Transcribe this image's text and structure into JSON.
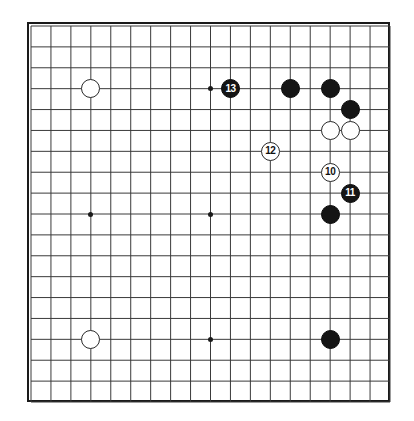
{
  "board": {
    "title": "Go board diagram",
    "size": 19,
    "line_color": "#3a3a3a",
    "border_color": "#1a1a1a",
    "background_color": "#ffffff",
    "black_stone_color": "#151515",
    "white_stone_color": "#ffffff",
    "star_points": [
      {
        "col": 3,
        "row": 3
      },
      {
        "col": 9,
        "row": 3
      },
      {
        "col": 15,
        "row": 3
      },
      {
        "col": 3,
        "row": 9
      },
      {
        "col": 9,
        "row": 9
      },
      {
        "col": 15,
        "row": 9
      },
      {
        "col": 3,
        "row": 15
      },
      {
        "col": 9,
        "row": 15
      },
      {
        "col": 15,
        "row": 15
      }
    ],
    "stones": [
      {
        "color": "white",
        "col": 3,
        "row": 3,
        "label": ""
      },
      {
        "color": "black",
        "col": 10,
        "row": 3,
        "label": "13"
      },
      {
        "color": "black",
        "col": 13,
        "row": 3,
        "label": ""
      },
      {
        "color": "black",
        "col": 15,
        "row": 3,
        "label": ""
      },
      {
        "color": "black",
        "col": 16,
        "row": 4,
        "label": ""
      },
      {
        "color": "white",
        "col": 15,
        "row": 5,
        "label": ""
      },
      {
        "color": "white",
        "col": 16,
        "row": 5,
        "label": ""
      },
      {
        "color": "white",
        "col": 12,
        "row": 6,
        "label": "12"
      },
      {
        "color": "white",
        "col": 15,
        "row": 7,
        "label": "10"
      },
      {
        "color": "black",
        "col": 16,
        "row": 8,
        "label": "11"
      },
      {
        "color": "black",
        "col": 15,
        "row": 9,
        "label": ""
      },
      {
        "color": "white",
        "col": 3,
        "row": 15,
        "label": ""
      },
      {
        "color": "black",
        "col": 15,
        "row": 15,
        "label": ""
      }
    ]
  }
}
